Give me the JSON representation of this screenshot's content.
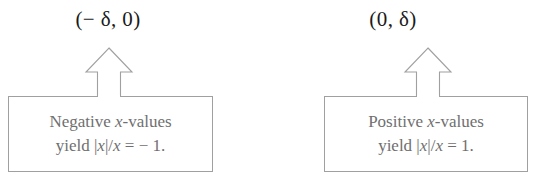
{
  "canvas": {
    "width": 536,
    "height": 178,
    "background": "#ffffff",
    "line_color": "#a0a0a0",
    "label_color": "#1a1a1a",
    "box_text_color": "#6f6f6f"
  },
  "callouts": [
    {
      "id": "negative-side",
      "coord_label": "(− δ, 0)",
      "arrow": "up-arrow-icon",
      "box": {
        "line1_prefix": "Negative ",
        "line1_var": "x",
        "line1_suffix": "-values",
        "line2_prefix": "yield |",
        "line2_var": "x",
        "line2_mid": "|/",
        "line2_var2": "x",
        "line2_suffix": " = − 1."
      }
    },
    {
      "id": "positive-side",
      "coord_label": "(0, δ)",
      "arrow": "up-arrow-icon",
      "box": {
        "line1_prefix": "Positive ",
        "line1_var": "x",
        "line1_suffix": "-values",
        "line2_prefix": "yield |",
        "line2_var": "x",
        "line2_mid": "|/",
        "line2_var2": "x",
        "line2_suffix": " = 1."
      }
    }
  ]
}
